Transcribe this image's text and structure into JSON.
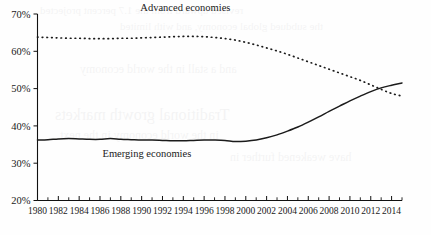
{
  "chart_data": {
    "type": "line",
    "title": "",
    "subtitle": "",
    "xlabel": "",
    "ylabel": "",
    "xlim": [
      1980,
      2015
    ],
    "ylim": [
      20,
      70
    ],
    "grid": false,
    "legend_position": "inline-annotations",
    "y_tick_labels": [
      "20%",
      "30%",
      "40%",
      "50%",
      "60%",
      "70%"
    ],
    "y_tick_values": [
      20,
      30,
      40,
      50,
      60,
      70
    ],
    "x_tick_labels": [
      "1980",
      "1982",
      "1984",
      "1986",
      "1988",
      "1990",
      "1992",
      "1994",
      "1996",
      "1998",
      "2000",
      "2002",
      "2004",
      "2006",
      "2008",
      "2010",
      "2012",
      "2014"
    ],
    "x_tick_values": [
      1980,
      1982,
      1984,
      1986,
      1988,
      1990,
      1992,
      1994,
      1996,
      1998,
      2000,
      2002,
      2004,
      2006,
      2008,
      2010,
      2012,
      2014
    ],
    "x_minor_ticks": [
      1981,
      1983,
      1985,
      1987,
      1989,
      1991,
      1993,
      1995,
      1997,
      1999,
      2001,
      2003,
      2005,
      2007,
      2009,
      2011,
      2013,
      2015
    ],
    "x": [
      1980,
      1981,
      1982,
      1983,
      1984,
      1985,
      1986,
      1987,
      1988,
      1989,
      1990,
      1991,
      1992,
      1993,
      1994,
      1995,
      1996,
      1997,
      1998,
      1999,
      2000,
      2001,
      2002,
      2003,
      2004,
      2005,
      2006,
      2007,
      2008,
      2009,
      2010,
      2011,
      2012,
      2013,
      2014,
      2015
    ],
    "series": [
      {
        "name": "Advanced economies",
        "style": "dotted",
        "color": "#1b1b1b",
        "label_x": 1994.2,
        "label_y": 70.8,
        "values": [
          63.8,
          63.7,
          63.6,
          63.5,
          63.5,
          63.4,
          63.4,
          63.4,
          63.5,
          63.5,
          63.6,
          63.7,
          63.8,
          63.9,
          64.0,
          64.0,
          63.9,
          63.7,
          63.4,
          63.0,
          62.4,
          61.7,
          60.9,
          60.1,
          59.2,
          58.2,
          57.2,
          56.2,
          55.2,
          54.2,
          53.2,
          52.2,
          51.0,
          49.8,
          48.7,
          48.0
        ]
      },
      {
        "name": "Emerging economies",
        "style": "solid",
        "color": "#1b1b1b",
        "label_x": 1990.5,
        "label_y": 31.6,
        "values": [
          36.2,
          36.3,
          36.5,
          36.6,
          36.5,
          36.4,
          36.4,
          36.6,
          36.4,
          36.3,
          36.2,
          36.2,
          36.1,
          36.0,
          36.0,
          36.1,
          36.2,
          36.2,
          36.1,
          35.8,
          35.9,
          36.2,
          36.8,
          37.6,
          38.6,
          39.7,
          41.0,
          42.4,
          43.9,
          45.3,
          46.7,
          48.0,
          49.2,
          50.2,
          50.9,
          51.5
        ]
      }
    ],
    "annotations": [
      {
        "text": "Advanced economies",
        "x": 1994.2,
        "y": 70.8
      },
      {
        "text": "Emerging economies",
        "x": 1990.5,
        "y": 31.6
      }
    ]
  },
  "background": {
    "bleed_lines": [
      "revised upward from the 1.7 percent projected",
      "the subdued global economy, and with limited",
      "Traditional growth markets",
      "in the world economy in the next",
      "and a stall in the world economy",
      "have weakened further in"
    ]
  },
  "colors": {
    "axis": "#111111",
    "series": "#1b1b1b",
    "background": "#fefefe",
    "text": "#1a1a1a"
  }
}
